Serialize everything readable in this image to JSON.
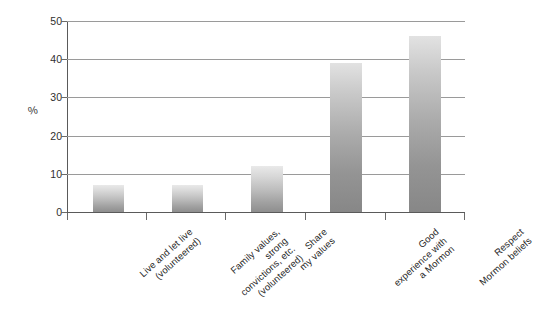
{
  "chart_data": {
    "type": "bar",
    "title": "",
    "subtitle": "",
    "xlabel": "",
    "ylabel": "%",
    "ylim": [
      0,
      50
    ],
    "ytick_values": [
      0,
      10,
      20,
      30,
      40,
      50
    ],
    "ytick_labels": [
      "0",
      "10",
      "20",
      "30",
      "40",
      "50"
    ],
    "grid": true,
    "grid_orientation": "horizontal",
    "legend": false,
    "legend_position": "none",
    "bar_fill": "vertical-gradient-gray",
    "categories": [
      "Live and let live (volunteered)",
      "Family values, strong convictions, etc. (volunteered)",
      "Share my values",
      "Good experience with a Mormon",
      "Respect Mormon beliefs"
    ],
    "category_label_lines": [
      [
        "Live and let live",
        "(volunteered)"
      ],
      [
        "Family values,",
        "strong",
        "convictions, etc.",
        "(volunteered)"
      ],
      [
        "Share",
        "my values"
      ],
      [
        "Good",
        "experience with",
        "a Mormon"
      ],
      [
        "Respect",
        "Mormon beliefs"
      ]
    ],
    "values": [
      7,
      7,
      12,
      39,
      46
    ],
    "colors": {
      "bar_top": "#e9e9e9",
      "bar_bottom": "#8e8e8e",
      "gridline": "#9a9a9a",
      "axis": "#5a5a5a",
      "text": "#262626",
      "background": "#ffffff"
    }
  }
}
